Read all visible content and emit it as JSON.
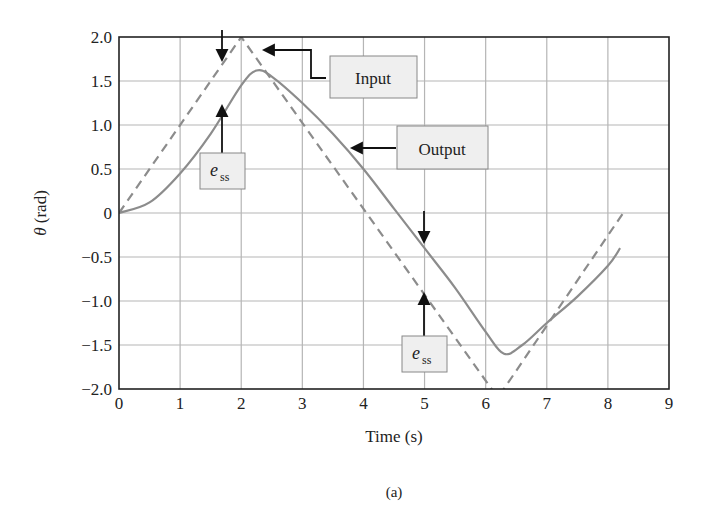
{
  "chart_data": {
    "type": "line",
    "title": "",
    "caption": "(a)",
    "xlabel": "Time (s)",
    "ylabel": "θ (rad)",
    "xlim": [
      0,
      9
    ],
    "ylim": [
      -2.0,
      2.0
    ],
    "xticks": [
      "0",
      "1",
      "2",
      "3",
      "4",
      "5",
      "6",
      "7",
      "8",
      "9"
    ],
    "yticks": [
      "2.0",
      "1.5",
      "1.0",
      "0.5",
      "0",
      "-0.5",
      "-1.0",
      "-1.5",
      "-2.0"
    ],
    "grid": true,
    "series": [
      {
        "name": "Input",
        "style": "dashed",
        "color": "#8c8c8c",
        "x": [
          0,
          2.0,
          6.2,
          8.25
        ],
        "y": [
          0,
          2.0,
          -2.1,
          0
        ]
      },
      {
        "name": "Output",
        "style": "solid",
        "color": "#8c8c8c",
        "x": [
          0,
          0.5,
          1.0,
          1.5,
          2.0,
          2.25,
          2.5,
          3.0,
          3.5,
          4.0,
          4.5,
          5.0,
          5.5,
          6.0,
          6.3,
          6.6,
          7.0,
          7.5,
          8.0,
          8.2
        ],
        "y": [
          0,
          0.12,
          0.45,
          0.9,
          1.45,
          1.62,
          1.55,
          1.25,
          0.9,
          0.5,
          0.05,
          -0.4,
          -0.85,
          -1.35,
          -1.6,
          -1.5,
          -1.25,
          -0.95,
          -0.6,
          -0.4
        ]
      }
    ],
    "annotations": [
      {
        "text": "Input",
        "points_to": "input line near t=2.4"
      },
      {
        "text": "Output",
        "points_to": "output line near t=3.8"
      },
      {
        "text": "e_ss",
        "points_to": "steady-state error between input and output near t=1.7"
      },
      {
        "text": "e_ss",
        "points_to": "steady-state error between input and output near t=5.0"
      }
    ]
  },
  "labels": {
    "input": "Input",
    "output": "Output",
    "ess_main": "e",
    "ess_sub": "ss",
    "xlabel": "Time (s)",
    "ylabel_theta": "θ",
    "ylabel_unit": " (rad)",
    "caption": "(a)"
  }
}
